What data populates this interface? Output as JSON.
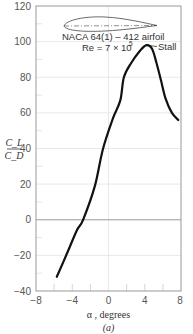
{
  "chart_data": {
    "type": "line",
    "title": "",
    "xlabel": "α , degrees",
    "ylabel": "C_L / C_D",
    "ylabel_num": "C_L",
    "ylabel_den": "C_D",
    "caption": "(a)",
    "xlim": [
      -8,
      8
    ],
    "ylim": [
      -40,
      120
    ],
    "xticks": [
      "−8",
      "−4",
      "0",
      "4",
      "8"
    ],
    "yticks": [
      "120",
      "100",
      "80",
      "60",
      "40",
      "20",
      "0",
      "−20",
      "−40"
    ],
    "grid": true,
    "annotations": {
      "airfoil_name": "NACA 64(1) – 412 airfoil",
      "reynolds": "Re = 7 × 10",
      "reynolds_exp": "5",
      "stall": "Stall"
    },
    "series": [
      {
        "name": "C_L/C_D vs α",
        "x": [
          -5.7,
          -4.5,
          -3.5,
          -2.8,
          -1.5,
          -0.6,
          0.5,
          1.3,
          1.7,
          2.5,
          3.5,
          4.2,
          4.8,
          5.3,
          5.8,
          6.3,
          7.0,
          7.7
        ],
        "values": [
          -32,
          -18,
          -6,
          0,
          19,
          40,
          57,
          67,
          80,
          88,
          95,
          98,
          96,
          88,
          78,
          68,
          60,
          56
        ]
      }
    ],
    "colors": {
      "curve": "#111111",
      "axes": "#999999",
      "grid": "#dddddd"
    }
  }
}
